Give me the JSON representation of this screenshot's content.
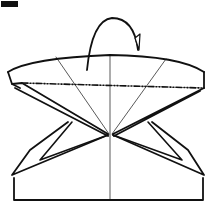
{
  "diagram": {
    "type": "origami-fold-step",
    "step_label": "",
    "colors": {
      "line": "#111111",
      "background": "#ffffff",
      "step_box": "#111111"
    },
    "elements": {
      "fold_arrow": "mountain-fold-back-arrow",
      "fold_line": "mountain-fold dash-dot line",
      "creases": [
        "center vertical crease",
        "left diagonal crease",
        "right diagonal crease"
      ]
    }
  }
}
